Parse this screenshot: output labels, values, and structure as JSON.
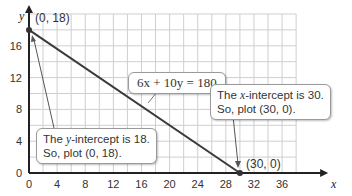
{
  "chart_data": {
    "type": "line",
    "title": "",
    "xlabel": "x",
    "ylabel": "y",
    "xlim": [
      0,
      38
    ],
    "ylim": [
      0,
      20
    ],
    "x_ticks": [
      0,
      4,
      8,
      12,
      16,
      20,
      24,
      28,
      32,
      36
    ],
    "y_ticks": [
      0,
      4,
      8,
      12,
      16
    ],
    "grid": true,
    "grid_step": 2,
    "series": [
      {
        "name": "6x + 10y = 180",
        "x": [
          0,
          30
        ],
        "y": [
          18,
          0
        ]
      }
    ],
    "points": [
      {
        "label": "(0, 18)",
        "x": 0,
        "y": 18
      },
      {
        "label": "(30, 0)",
        "x": 30,
        "y": 0
      }
    ],
    "annotations": [
      {
        "text": "6x + 10y = 180",
        "target": "line"
      },
      {
        "text": "The y-intercept is 18. So, plot (0, 18).",
        "target": "(0, 18)"
      },
      {
        "text": "The x-intercept is 30. So, plot (30, 0).",
        "target": "(30, 0)"
      }
    ]
  },
  "labels": {
    "x_axis": "x",
    "y_axis": "y",
    "point_y_intercept": "(0, 18)",
    "point_x_intercept": "(30, 0)",
    "equation": "6x + 10y = 180",
    "y_callout_line1_pre": "The ",
    "y_callout_var": "y",
    "y_callout_line1_post": "-intercept is 18.",
    "y_callout_line2": "So, plot (0, 18).",
    "x_callout_line1_pre": "The ",
    "x_callout_var": "x",
    "x_callout_line1_post": "-intercept is 30.",
    "x_callout_line2": "So, plot (30, 0)."
  },
  "colors": {
    "grid": "#cfcfcf",
    "axis": "#222222",
    "line": "#3a3a3a",
    "point": "#333333"
  }
}
